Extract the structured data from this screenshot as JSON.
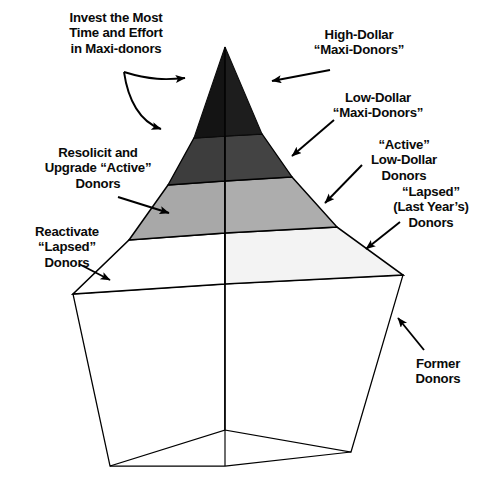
{
  "diagram": {
    "type": "pyramid-diagram",
    "tier_count": 5,
    "palette": {
      "tier1_fill": "#1a1a1a",
      "tier2_fill": "#3d3d3d",
      "tier3_fill": "#a8a8a8",
      "tier4_fill": "#ffffff",
      "base_fill": "#ffffff",
      "cap_fill": "#e9e9e9",
      "stroke": "#000000",
      "page_bg": "#ffffff",
      "text": "#0a0a0a"
    }
  },
  "tiers": [
    {
      "id": "tier-1",
      "rank": 1,
      "fill": "#1a1a1a",
      "right_label": "High-Dollar\n“Maxi-Donors”",
      "left_label": "Invest the Most\nTime and Effort\nin Maxi-donors"
    },
    {
      "id": "tier-2",
      "rank": 2,
      "fill": "#3d3d3d",
      "right_label": "Low-Dollar\n“Maxi-Donors”",
      "left_label": "Invest the Most\nTime and Effort\nin Maxi-donors"
    },
    {
      "id": "tier-3",
      "rank": 3,
      "fill": "#a8a8a8",
      "right_label": "“Active”\nLow-Dollar\nDonors",
      "left_label": "Resolicit and\nUpgrade “Active”\nDonors"
    },
    {
      "id": "tier-4",
      "rank": 4,
      "fill": "#ffffff",
      "right_label": "“Lapsed”\n(Last Year’s)\nDonors",
      "left_label": "Reactivate\n“Lapsed”\nDonors"
    },
    {
      "id": "tier-5",
      "rank": 5,
      "fill": "#ffffff",
      "right_label": "Former\nDonors",
      "left_label": ""
    }
  ],
  "labels_left": [
    {
      "id": "invest",
      "text": "Invest the Most\nTime and Effort\nin Maxi-donors",
      "targets": [
        "tier-1",
        "tier-2"
      ],
      "arrow": "curved-double"
    },
    {
      "id": "resolicit",
      "text": "Resolicit and\nUpgrade “Active”\nDonors",
      "targets": [
        "tier-3"
      ],
      "arrow": "straight"
    },
    {
      "id": "reactivate",
      "text": "Reactivate\n“Lapsed”\nDonors",
      "targets": [
        "tier-4"
      ],
      "arrow": "straight"
    }
  ],
  "labels_right": [
    {
      "id": "high",
      "text": "High-Dollar\n“Maxi-Donors”",
      "target": "tier-1",
      "arrow": "straight"
    },
    {
      "id": "low",
      "text": "Low-Dollar\n“Maxi-Donors”",
      "target": "tier-2",
      "arrow": "straight"
    },
    {
      "id": "active",
      "text": "“Active”\nLow-Dollar\nDonors",
      "target": "tier-3",
      "arrow": "straight"
    },
    {
      "id": "lapsed",
      "text": "“Lapsed”\n(Last Year’s)\nDonors",
      "target": "tier-4",
      "arrow": "straight"
    },
    {
      "id": "former",
      "text": "Former\nDonors",
      "target": "tier-5",
      "arrow": "straight"
    }
  ]
}
